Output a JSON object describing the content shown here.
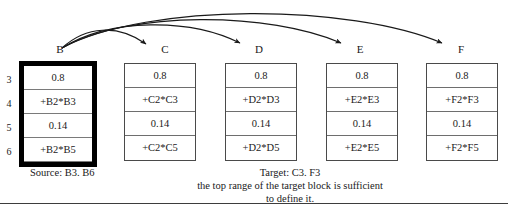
{
  "figure": {
    "row_numbers": [
      "3",
      "4",
      "5",
      "6"
    ],
    "columns": [
      {
        "letter": "B",
        "role": "source",
        "cells": [
          "0.8",
          "+B2*B3",
          "0.14",
          "+B2*B5"
        ]
      },
      {
        "letter": "C",
        "role": "target",
        "cells": [
          "0.8",
          "+C2*C3",
          "0.14",
          "+C2*C5"
        ]
      },
      {
        "letter": "D",
        "role": "target",
        "cells": [
          "0.8",
          "+D2*D3",
          "0.14",
          "+D2*D5"
        ]
      },
      {
        "letter": "E",
        "role": "target",
        "cells": [
          "0.8",
          "+E2*E3",
          "0.14",
          "+E2*E5"
        ]
      },
      {
        "letter": "F",
        "role": "target",
        "cells": [
          "0.8",
          "+F2*F3",
          "0.14",
          "+F2*F5"
        ]
      }
    ],
    "source_caption": "Source: B3. B6",
    "target_caption": {
      "line1": "Target: C3. F3",
      "line2": "the top range of the target block is sufficient",
      "line3": "to define it."
    },
    "arrows": [
      {
        "from": "B",
        "to": "C"
      },
      {
        "from": "B",
        "to": "D"
      },
      {
        "from": "B",
        "to": "E"
      },
      {
        "from": "B",
        "to": "F"
      }
    ],
    "colors": {
      "ink": "#1a1a1a",
      "cell_border": "#6e6e6e",
      "source_border": "#000000",
      "rule": "#3d3d3d",
      "background": "#ffffff"
    }
  }
}
